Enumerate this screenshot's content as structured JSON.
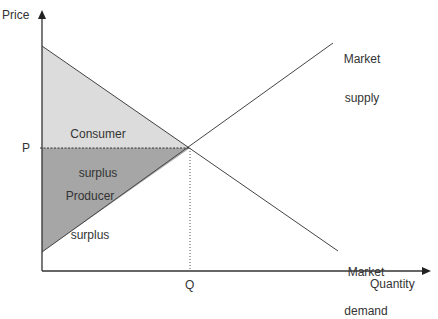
{
  "axes": {
    "y_label": "Price",
    "x_label": "Quantity",
    "p_tick": "P",
    "q_tick": "Q"
  },
  "regions": {
    "consumer": {
      "line1": "Consumer",
      "line2": "surplus",
      "fill": "#dcdcdc"
    },
    "producer": {
      "line1": "Producer",
      "line2": "surplus",
      "fill": "#a6a6a6"
    }
  },
  "curves": {
    "supply": {
      "line1": "Market",
      "line2": "supply"
    },
    "demand": {
      "line1": "Market",
      "line2": "demand"
    }
  }
}
